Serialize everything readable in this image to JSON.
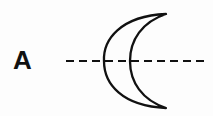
{
  "diagram": {
    "label": "A",
    "axis": {
      "style": "dashed",
      "orientation": "horizontal",
      "color": "#111111"
    },
    "shape": {
      "type": "crescent",
      "opening": "right",
      "fill": "none",
      "stroke": "#111111"
    }
  }
}
